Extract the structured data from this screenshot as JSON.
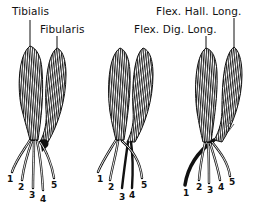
{
  "labels": {
    "tibialis": "Tibialis",
    "fibularis": "Fibularis",
    "flex_dig_long": "Flex. Dig. Long.",
    "flex_hall_long": "Flex. Hall. Long."
  },
  "figures": [
    {
      "name": "left",
      "tendon_numbers": [
        "1",
        "2",
        "3",
        "4",
        "5"
      ]
    },
    {
      "name": "middle",
      "tendon_numbers": [
        "1",
        "2",
        "3",
        "4",
        "5"
      ]
    },
    {
      "name": "right",
      "tendon_numbers": [
        "1",
        "2",
        "3",
        "4",
        "5"
      ]
    }
  ],
  "colors": {
    "ink": "#111111",
    "background": "#ffffff"
  }
}
